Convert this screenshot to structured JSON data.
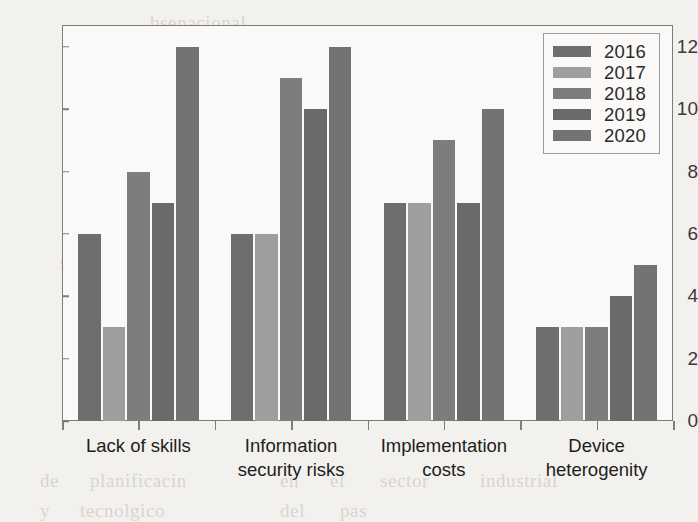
{
  "chart_data": {
    "type": "bar",
    "title": "",
    "subtitle": "",
    "xlabel": "",
    "ylabel": "",
    "ylim": [
      0,
      12.7
    ],
    "yticks": [
      0,
      2,
      4,
      6,
      8,
      10,
      12
    ],
    "ytick_labels": [
      "0",
      "2",
      "4",
      "6",
      "8",
      "10",
      "12"
    ],
    "grid": false,
    "legend_position": "top-right",
    "categories": [
      "Lack of skills",
      "Information\nsecurity risks",
      "Implementation\ncosts",
      "Device\nheterogenity"
    ],
    "series": [
      {
        "name": "2016",
        "color": "#6e6e6e",
        "values": [
          6,
          6,
          7,
          3
        ]
      },
      {
        "name": "2017",
        "color": "#9e9e9e",
        "values": [
          3,
          6,
          7,
          3
        ]
      },
      {
        "name": "2018",
        "color": "#7d7d7d",
        "values": [
          8,
          11,
          9,
          3
        ]
      },
      {
        "name": "2019",
        "color": "#6a6a6a",
        "values": [
          7,
          10,
          7,
          4
        ]
      },
      {
        "name": "2020",
        "color": "#737373",
        "values": [
          12,
          12,
          10,
          5
        ]
      }
    ]
  },
  "legend": {
    "entries": [
      "2016",
      "2017",
      "2018",
      "2019",
      "2020"
    ]
  },
  "background_text": [
    {
      "text": "bsenacional",
      "x": 150,
      "y": 12
    },
    {
      "text": "nsemble",
      "x": 400,
      "y": 40
    },
    {
      "text": "stistics",
      "x": 215,
      "y": 96
    },
    {
      "text": "nmeros",
      "x": 420,
      "y": 96
    },
    {
      "text": "the",
      "x": 90,
      "y": 150
    },
    {
      "text": "conclusiones",
      "x": 190,
      "y": 150
    },
    {
      "text": "problemas",
      "x": 390,
      "y": 150
    },
    {
      "text": "herramientas",
      "x": 110,
      "y": 196
    },
    {
      "text": "de",
      "x": 300,
      "y": 196
    },
    {
      "text": "evaluacin",
      "x": 350,
      "y": 196
    },
    {
      "text": "sobre",
      "x": 60,
      "y": 252
    },
    {
      "text": "la",
      "x": 170,
      "y": 252
    },
    {
      "text": "gestin",
      "x": 230,
      "y": 252
    },
    {
      "text": "en",
      "x": 340,
      "y": 252
    },
    {
      "text": "los",
      "x": 400,
      "y": 252
    },
    {
      "text": "procesos",
      "x": 455,
      "y": 252
    },
    {
      "text": "de",
      "x": 40,
      "y": 470
    },
    {
      "text": "planificacin",
      "x": 90,
      "y": 470
    },
    {
      "text": "en",
      "x": 280,
      "y": 470
    },
    {
      "text": "el",
      "x": 330,
      "y": 470
    },
    {
      "text": "sector",
      "x": 380,
      "y": 470
    },
    {
      "text": "industrial",
      "x": 480,
      "y": 470
    },
    {
      "text": "y",
      "x": 40,
      "y": 500
    },
    {
      "text": "tecnolgico",
      "x": 80,
      "y": 500
    },
    {
      "text": "del",
      "x": 280,
      "y": 500
    },
    {
      "text": "pas",
      "x": 340,
      "y": 500
    }
  ]
}
